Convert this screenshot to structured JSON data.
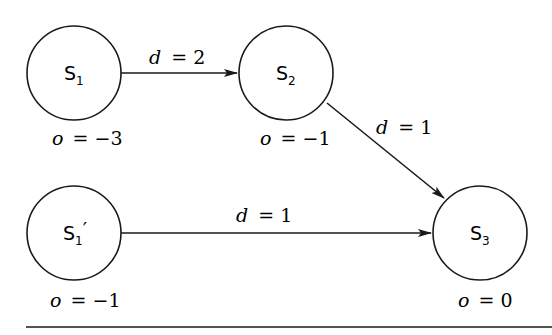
{
  "diagram": {
    "nodes": [
      {
        "id": "s1",
        "base": "S",
        "sub": "1",
        "prime": "",
        "o_label": "o = −3",
        "o_var": "o",
        "o_val": "= −3"
      },
      {
        "id": "s2",
        "base": "S",
        "sub": "2",
        "prime": "",
        "o_label": "o = −1",
        "o_var": "o",
        "o_val": "= −1"
      },
      {
        "id": "s1p",
        "base": "S",
        "sub": "1",
        "prime": "′",
        "o_label": "o = −1",
        "o_var": "o",
        "o_val": "= −1"
      },
      {
        "id": "s3",
        "base": "S",
        "sub": "3",
        "prime": "",
        "o_label": "o = 0",
        "o_var": "o",
        "o_val": "= 0"
      }
    ],
    "edges": [
      {
        "from": "s1",
        "to": "s2",
        "var": "d",
        "val": "= 2"
      },
      {
        "from": "s2",
        "to": "s3",
        "var": "d",
        "val": "= 1"
      },
      {
        "from": "s1p",
        "to": "s3",
        "var": "d",
        "val": "= 1"
      }
    ],
    "colors": {
      "stroke": "#1a1a1a",
      "background": "#ffffff"
    }
  }
}
